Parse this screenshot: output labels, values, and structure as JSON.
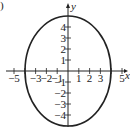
{
  "panel_label": ")",
  "chart_data": {
    "type": "line",
    "title": "",
    "equation": "x^2/16 + y^2/25 = 1",
    "center": [
      0,
      0
    ],
    "semi_axis_x": 4,
    "semi_axis_y": 5,
    "xlabel": "x",
    "ylabel": "y",
    "xlim": [
      -5.5,
      5.5
    ],
    "ylim": [
      -5,
      5
    ],
    "x_ticks": [
      -5,
      -4,
      -3,
      -2,
      -1,
      1,
      2,
      3,
      4,
      5
    ],
    "x_tick_labels": [
      "-5",
      "-3",
      "-2",
      "-1",
      "1",
      "2",
      "3",
      "5"
    ],
    "y_ticks": [
      -4,
      -3,
      -2,
      -1,
      1,
      2,
      3,
      4
    ],
    "y_tick_labels": [
      "4",
      "3",
      "2",
      "1",
      "-1",
      "-2",
      "-3",
      "-4"
    ],
    "grid": false,
    "legend": null,
    "color": "#222222"
  }
}
